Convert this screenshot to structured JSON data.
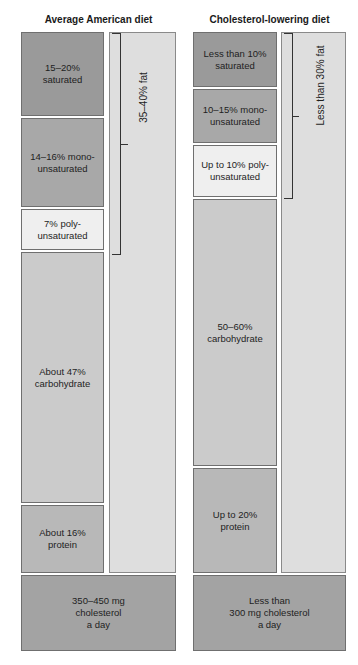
{
  "left": {
    "title": "Average American diet",
    "saturated": "15–20%\nsaturated",
    "mono": "14–16% mono-\nunsaturated",
    "poly": "7% poly-\nunsaturated",
    "carbohydrate": "About 47%\ncarbohydrate",
    "protein": "About 16%\nprotein",
    "fat_label": "35–40% fat",
    "cholesterol": "350–450 mg\ncholesterol\na day"
  },
  "right": {
    "title": "Cholesterol-lowering diet",
    "saturated": "Less than 10%\nsaturated",
    "mono": "10–15% mono-\nunsaturated",
    "poly": "Up to 10% poly-\nunsaturated",
    "carbohydrate": "50–60%\ncarbohydrate",
    "protein": "Up to 20%\nprotein",
    "fat_label": "Less than 30% fat",
    "cholesterol": "Less than\n300 mg cholesterol\na day"
  },
  "colors": {
    "saturated": "#9a9a9a",
    "mono": "#a8a8a8",
    "poly": "#efefef",
    "carbohydrate": "#cbcbcb",
    "protein": "#b8b8b8",
    "fat_column": "#dedede",
    "cholesterol": "#a3a3a3"
  }
}
